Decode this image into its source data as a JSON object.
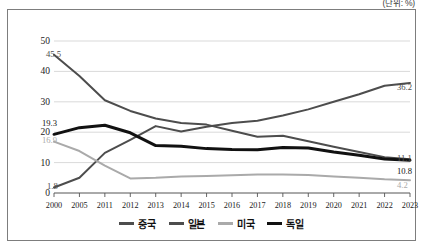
{
  "unit_note": "(단위: %)",
  "chart_data": {
    "type": "line",
    "title": "",
    "subtitle": "",
    "xlabel": "",
    "ylabel": "",
    "unit": "%",
    "grid": true,
    "legend_position": "bottom",
    "ylim": [
      0,
      50
    ],
    "yticks": [
      0,
      10,
      20,
      30,
      40,
      50
    ],
    "categories": [
      "2000",
      "2005",
      "2011",
      "2012",
      "2013",
      "2014",
      "2015",
      "2016",
      "2017",
      "2018",
      "2019",
      "2020",
      "2021",
      "2022",
      "2023"
    ],
    "series": [
      {
        "name": "중국",
        "color": "#4d4d4d",
        "width": 2.0,
        "values": [
          1.8,
          5.0,
          13.2,
          17.5,
          22.0,
          20.2,
          21.8,
          23.0,
          23.8,
          25.5,
          27.5,
          30.0,
          32.5,
          35.3,
          36.2
        ]
      },
      {
        "name": "일본",
        "color": "#4d4d4d",
        "width": 2.0,
        "values": [
          45.5,
          38.5,
          30.5,
          27.0,
          24.5,
          23.0,
          22.5,
          20.5,
          18.5,
          18.8,
          17.0,
          15.2,
          13.5,
          11.8,
          11.1
        ]
      },
      {
        "name": "미국",
        "color": "#aaaaaa",
        "width": 2.0,
        "values": [
          16.9,
          13.8,
          9.0,
          4.8,
          5.0,
          5.4,
          5.6,
          5.8,
          6.1,
          6.1,
          5.9,
          5.4,
          5.0,
          4.5,
          4.2
        ]
      },
      {
        "name": "독일",
        "color": "#111111",
        "width": 3.0,
        "values": [
          19.3,
          21.5,
          22.3,
          19.8,
          15.6,
          15.4,
          14.6,
          14.3,
          14.2,
          15.0,
          14.8,
          13.5,
          12.4,
          11.2,
          10.8
        ]
      }
    ],
    "annotations": [
      {
        "text": "45.5",
        "color": "#4d4d4d",
        "x": 38,
        "y": 39,
        "align": "left"
      },
      {
        "text": "19.3",
        "color": "#111111",
        "x": 34,
        "y": 108,
        "align": "left"
      },
      {
        "text": "16.9",
        "color": "#aaaaaa",
        "x": 34,
        "y": 125,
        "align": "left"
      },
      {
        "text": "1.8",
        "color": "#4d4d4d",
        "x": 39,
        "y": 171,
        "align": "left"
      },
      {
        "text": "36.2",
        "color": "#4d4d4d",
        "x": 389,
        "y": 72,
        "align": "left"
      },
      {
        "text": "11.1",
        "color": "#4d4d4d",
        "x": 389,
        "y": 143,
        "align": "left"
      },
      {
        "text": "10.8",
        "color": "#111111",
        "x": 389,
        "y": 156,
        "align": "left"
      },
      {
        "text": "4.2",
        "color": "#aaaaaa",
        "x": 389,
        "y": 170,
        "align": "left"
      }
    ],
    "legend": [
      {
        "label": "중국",
        "color": "#4d4d4d",
        "thickness": 2.6
      },
      {
        "label": "일본",
        "color": "#4d4d4d",
        "thickness": 2.6
      },
      {
        "label": "미국",
        "color": "#aaaaaa",
        "thickness": 2.4
      },
      {
        "label": "독일",
        "color": "#111111",
        "thickness": 3.4
      }
    ]
  }
}
